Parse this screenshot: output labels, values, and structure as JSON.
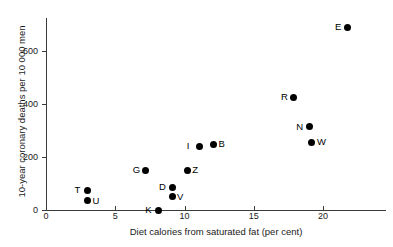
{
  "chart_data": {
    "type": "scatter",
    "title": "",
    "xlabel": "Diet calories from saturated fat (per cent)",
    "ylabel": "10-year coronary deaths per 10 000 men",
    "xlim": [
      0,
      24
    ],
    "ylim": [
      0,
      720
    ],
    "xticks": [
      0,
      5,
      10,
      15,
      20
    ],
    "yticks": [
      0,
      200,
      400,
      600
    ],
    "xtick_labels": [
      "0",
      "5",
      "10",
      "15",
      "20"
    ],
    "ytick_labels": [
      "0",
      "200",
      "400",
      "600"
    ],
    "grid": false,
    "legend": "none",
    "point_labels_position": "beside markers",
    "points": [
      {
        "label": "T",
        "x": 3.0,
        "y": 75,
        "label_side": "left"
      },
      {
        "label": "U",
        "x": 3.0,
        "y": 35,
        "label_side": "right"
      },
      {
        "label": "K",
        "x": 8.1,
        "y": 0,
        "label_side": "left"
      },
      {
        "label": "G",
        "x": 7.2,
        "y": 150,
        "label_side": "left"
      },
      {
        "label": "D",
        "x": 9.1,
        "y": 85,
        "label_side": "left"
      },
      {
        "label": "V",
        "x": 9.1,
        "y": 50,
        "label_side": "right"
      },
      {
        "label": "Z",
        "x": 10.2,
        "y": 150,
        "label_side": "right"
      },
      {
        "label": "I",
        "x": 11.1,
        "y": 240,
        "label_side": "left"
      },
      {
        "label": "B",
        "x": 12.1,
        "y": 248,
        "label_side": "right"
      },
      {
        "label": "R",
        "x": 17.9,
        "y": 425,
        "label_side": "left"
      },
      {
        "label": "N",
        "x": 19.0,
        "y": 315,
        "label_side": "left"
      },
      {
        "label": "W",
        "x": 19.2,
        "y": 255,
        "label_side": "right"
      },
      {
        "label": "E",
        "x": 21.8,
        "y": 690,
        "label_side": "left"
      }
    ],
    "colors": {
      "marker": "#000000",
      "axis": "#3a3a3a",
      "text": "#000000",
      "background": "#ffffff"
    }
  }
}
